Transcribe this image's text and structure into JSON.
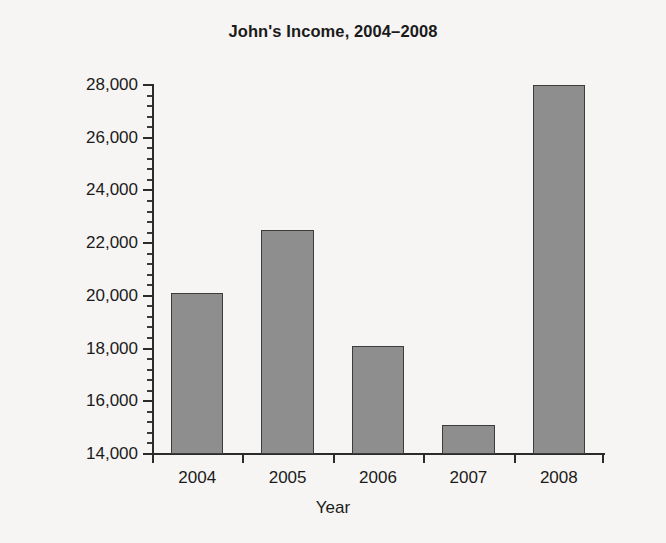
{
  "chart_data": {
    "type": "bar",
    "title": "John's Income, 2004–2008",
    "xlabel": "Year",
    "ylabel": "Income, in Dollars",
    "categories": [
      "2004",
      "2005",
      "2006",
      "2007",
      "2008"
    ],
    "values": [
      20100,
      22500,
      18100,
      15100,
      28000
    ],
    "ylim": [
      14000,
      28000
    ],
    "ytick_labels": [
      "14,000",
      "16,000",
      "18,000",
      "20,000",
      "22,000",
      "24,000",
      "26,000",
      "28,000"
    ],
    "ytick_values": [
      14000,
      16000,
      18000,
      20000,
      22000,
      24000,
      26000,
      28000
    ],
    "minor_tick_step": 400,
    "grid": false,
    "legend": null,
    "bar_color": "#8e8e8e",
    "bar_edge_color": "#3c3c3c",
    "axis_color": "#2b2b2b",
    "background_color": "#f6f5f3",
    "text_color": "#1b1b1b"
  }
}
